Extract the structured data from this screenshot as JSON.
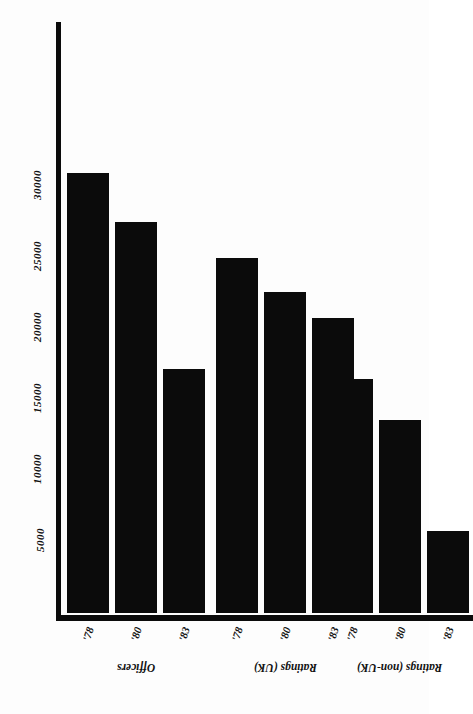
{
  "chart_data": {
    "type": "bar",
    "title": "Decline of number of seafarers '78 - '83",
    "xlabel": "",
    "ylabel": "",
    "ylim": [
      0,
      33000
    ],
    "grid": false,
    "legend": "none",
    "orientation": "page-rotated-180",
    "yticks": [
      5000,
      10000,
      15000,
      20000,
      25000,
      30000
    ],
    "ytick_labels": [
      "5000",
      "10000",
      "15000",
      "20000",
      "25000",
      "30000"
    ],
    "groups": [
      {
        "name": "Officers",
        "categories": [
          "'78",
          "'80",
          "'83"
        ],
        "values": [
          31000,
          27500,
          17200
        ]
      },
      {
        "name": "Ratings (UK)",
        "categories": [
          "'78",
          "'80",
          "'83"
        ],
        "values": [
          25000,
          22600,
          20800
        ]
      },
      {
        "name": "Ratings (non-UK)",
        "categories": [
          "'78",
          "'80",
          "'83"
        ],
        "values": [
          16500,
          13600,
          5800
        ]
      }
    ],
    "categories": [
      "'78",
      "'80",
      "'83",
      "'78",
      "'80",
      "'83",
      "'78",
      "'80",
      "'83"
    ],
    "values": [
      31000,
      27500,
      17200,
      25000,
      22600,
      20800,
      16500,
      13600,
      5800
    ],
    "bar_color": "#0b0b0b",
    "background_color": "#fdfdfd"
  }
}
